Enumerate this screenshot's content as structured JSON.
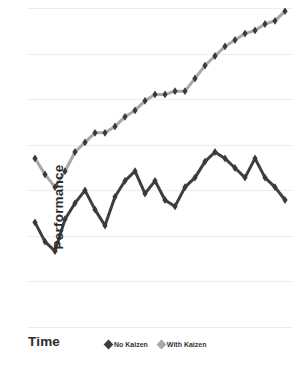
{
  "chart_data": {
    "type": "line",
    "title": "",
    "subtitle": "",
    "xlabel": "Time",
    "ylabel": "Performance",
    "grid": true,
    "gridlines_count": 8,
    "legend_position": "bottom-center",
    "axis_tick_labels": [],
    "xlim": [
      0,
      25
    ],
    "ylim": [
      0,
      100
    ],
    "x": [
      0,
      1,
      2,
      3,
      4,
      5,
      6,
      7,
      8,
      9,
      10,
      11,
      12,
      13,
      14,
      15,
      16,
      17,
      18,
      19,
      20,
      21,
      22,
      23,
      24,
      25
    ],
    "series": [
      {
        "name": "No Kaizen",
        "color": "#3f3f3f",
        "marker": "diamond",
        "values": [
          33,
          27,
          24,
          34,
          39,
          43,
          37,
          32,
          41,
          46,
          49,
          42,
          46,
          40,
          38,
          44,
          47,
          52,
          55,
          53,
          50,
          47,
          53,
          47,
          44,
          40
        ]
      },
      {
        "name": "With Kaizen",
        "color": "#a8a8a8",
        "marker": "diamond",
        "values": [
          53,
          48,
          44,
          49,
          55,
          58,
          61,
          61,
          63,
          66,
          68,
          71,
          73,
          73,
          74,
          74,
          78,
          82,
          85,
          88,
          90,
          92,
          93,
          95,
          96,
          99
        ]
      }
    ]
  },
  "legend": {
    "items": [
      {
        "label": "No Kaizen",
        "color": "#3f3f3f"
      },
      {
        "label": "With Kaizen",
        "color": "#a8a8a8"
      }
    ]
  },
  "axes": {
    "x_title": "Time",
    "y_title": "Performance"
  },
  "colors": {
    "gridline": "#ededed",
    "background": "#ffffff",
    "text": "#2b2b2b"
  }
}
